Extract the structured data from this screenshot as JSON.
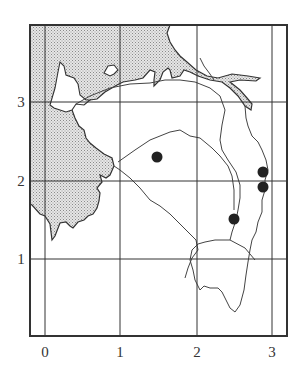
{
  "map": {
    "x_axis_labels": [
      "0",
      "1",
      "2",
      "3"
    ],
    "y_axis_labels": [
      "1",
      "2",
      "3"
    ],
    "colors": {
      "line": "#333333",
      "land_shade": "#c8c8c8",
      "dot": "#222222"
    },
    "points": [
      {
        "x": 1.5,
        "y": 2.3
      },
      {
        "x": 2.9,
        "y": 2.1
      },
      {
        "x": 2.9,
        "y": 1.9
      },
      {
        "x": 2.5,
        "y": 1.5
      }
    ]
  }
}
